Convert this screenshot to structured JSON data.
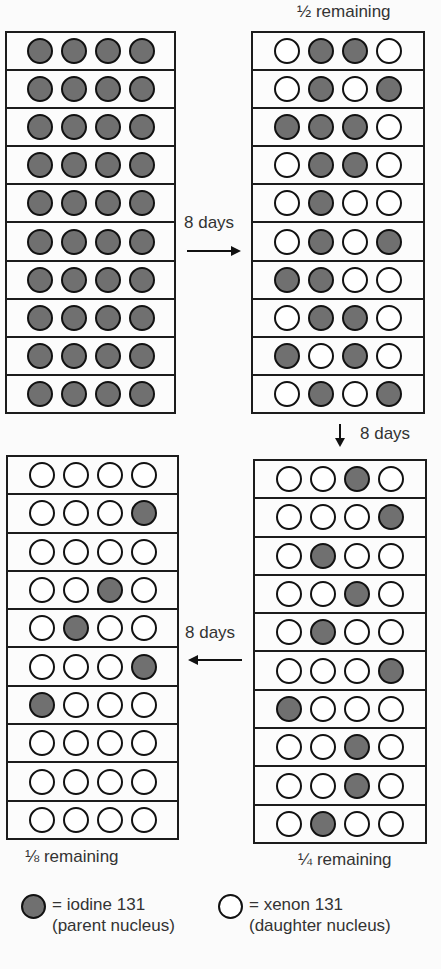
{
  "colors": {
    "parent_fill": "#707070",
    "daughter_fill": "#ffffff",
    "outline": "#111111"
  },
  "panels": [
    {
      "id": "start",
      "caption": "",
      "rows": [
        [
          1,
          1,
          1,
          1
        ],
        [
          1,
          1,
          1,
          1
        ],
        [
          1,
          1,
          1,
          1
        ],
        [
          1,
          1,
          1,
          1
        ],
        [
          1,
          1,
          1,
          1
        ],
        [
          1,
          1,
          1,
          1
        ],
        [
          1,
          1,
          1,
          1
        ],
        [
          1,
          1,
          1,
          1
        ],
        [
          1,
          1,
          1,
          1
        ],
        [
          1,
          1,
          1,
          1
        ]
      ]
    },
    {
      "id": "half",
      "caption": "½ remaining",
      "rows": [
        [
          0,
          1,
          1,
          0
        ],
        [
          0,
          1,
          0,
          1
        ],
        [
          1,
          1,
          1,
          0
        ],
        [
          0,
          1,
          1,
          0
        ],
        [
          0,
          1,
          0,
          0
        ],
        [
          0,
          1,
          0,
          1
        ],
        [
          1,
          1,
          0,
          0
        ],
        [
          0,
          1,
          1,
          0
        ],
        [
          1,
          0,
          1,
          0
        ],
        [
          0,
          1,
          0,
          1
        ]
      ]
    },
    {
      "id": "quarter",
      "caption": "¼ remaining",
      "rows": [
        [
          0,
          0,
          1,
          0
        ],
        [
          0,
          0,
          0,
          1
        ],
        [
          0,
          1,
          0,
          0
        ],
        [
          0,
          0,
          1,
          0
        ],
        [
          0,
          1,
          0,
          0
        ],
        [
          0,
          0,
          0,
          1
        ],
        [
          1,
          0,
          0,
          0
        ],
        [
          0,
          0,
          1,
          0
        ],
        [
          0,
          0,
          1,
          0
        ],
        [
          0,
          1,
          0,
          0
        ]
      ]
    },
    {
      "id": "eighth",
      "caption": "⅛ remaining",
      "rows": [
        [
          0,
          0,
          0,
          0
        ],
        [
          0,
          0,
          0,
          1
        ],
        [
          0,
          0,
          0,
          0
        ],
        [
          0,
          0,
          1,
          0
        ],
        [
          0,
          1,
          0,
          0
        ],
        [
          0,
          0,
          0,
          1
        ],
        [
          1,
          0,
          0,
          0
        ],
        [
          0,
          0,
          0,
          0
        ],
        [
          0,
          0,
          0,
          0
        ],
        [
          0,
          0,
          0,
          0
        ]
      ]
    }
  ],
  "arrows": [
    {
      "id": "start-to-half",
      "label": "8 days",
      "direction": "right"
    },
    {
      "id": "half-to-quarter",
      "label": "8 days",
      "direction": "down"
    },
    {
      "id": "quarter-to-eighth",
      "label": "8 days",
      "direction": "left"
    }
  ],
  "legend": {
    "parent": {
      "line1": "= iodine 131",
      "line2": "(parent nucleus)",
      "icon": "filled-circle"
    },
    "daughter": {
      "line1": "= xenon 131",
      "line2": "(daughter nucleus)",
      "icon": "empty-circle"
    }
  }
}
